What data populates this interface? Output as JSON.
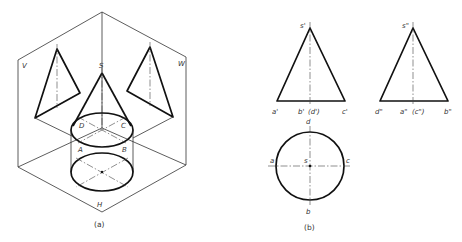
{
  "figure_a": {
    "caption": "(a)",
    "plane_labels": {
      "v": "V",
      "w": "W",
      "h": "H"
    },
    "apex_label": "S",
    "base_labels": {
      "d": "D",
      "c": "C",
      "a": "A",
      "b": "B"
    }
  },
  "figure_b": {
    "caption": "(b)",
    "front_view": {
      "apex": "s'",
      "base_labels": [
        "a'",
        "b'",
        "(d')",
        "c'"
      ]
    },
    "side_view": {
      "apex": "s\"",
      "base_labels": [
        "d\"",
        "a\"",
        "(c\")",
        "b\""
      ]
    },
    "top_view": {
      "labels": {
        "a": "a",
        "b": "b",
        "c": "c",
        "d": "d",
        "s": "s"
      }
    }
  }
}
